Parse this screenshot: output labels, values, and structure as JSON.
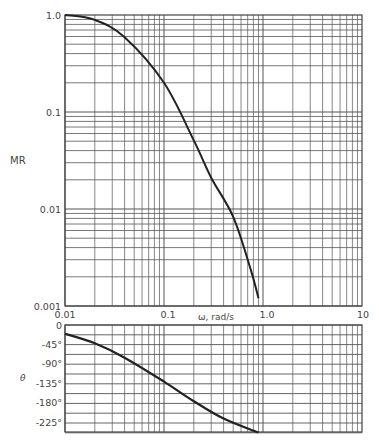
{
  "chart_data": [
    {
      "type": "line",
      "title": "",
      "xlabel": "ω, rad/s",
      "ylabel": "MR",
      "xscale": "log",
      "yscale": "log",
      "xlim": [
        0.01,
        10
      ],
      "ylim": [
        0.001,
        1.0
      ],
      "grid": true,
      "xticks": [
        "0.01",
        "0.1",
        "1.0",
        "10"
      ],
      "yticks": [
        "1.0",
        "0.1",
        "0.01",
        "0.001"
      ],
      "series": [
        {
          "name": "MR",
          "x": [
            0.01,
            0.02,
            0.04,
            0.1,
            0.2,
            0.3,
            0.5,
            0.75,
            0.9
          ],
          "y": [
            1.0,
            0.89,
            0.59,
            0.2,
            0.051,
            0.021,
            0.0083,
            0.0024,
            0.0012
          ]
        }
      ]
    },
    {
      "type": "line",
      "title": "",
      "xlabel": "",
      "ylabel": "θ",
      "xscale": "log",
      "xlim": [
        0.01,
        10
      ],
      "ylim": [
        -247.5,
        0
      ],
      "grid": true,
      "yticks": [
        "0",
        "-45°",
        "-90°",
        "-135°",
        "-180°",
        "-225°"
      ],
      "series": [
        {
          "name": "θ",
          "x": [
            0.01,
            0.02,
            0.04,
            0.1,
            0.2,
            0.4,
            0.9
          ],
          "y": [
            -20,
            -42,
            -75,
            -130,
            -175,
            -215,
            -247
          ]
        }
      ]
    }
  ],
  "labels": {
    "mr_axis": "MR",
    "theta_axis": "θ",
    "omega_axis": "ω, rad/s",
    "x_ticks": [
      "0.01",
      "0.1",
      "1.0",
      "10"
    ],
    "mr_ticks": [
      "1.0",
      "0.1",
      "0.01",
      "0.001"
    ],
    "theta_ticks": [
      "0",
      "-45°",
      "-90°",
      "-135°",
      "-180°",
      "-225°"
    ]
  },
  "style": {
    "line_color": "#222222",
    "grid_color": "#555555",
    "text_color": "#444444"
  }
}
